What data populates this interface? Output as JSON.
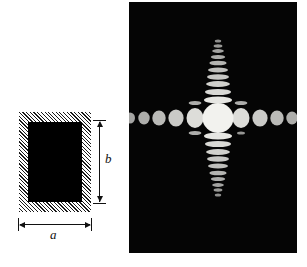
{
  "figure": {
    "background_color": "#ffffff"
  },
  "aperture_diagram": {
    "name": "rectangular-aperture",
    "screen_fill": "hatched",
    "hatch_angle_deg": 45,
    "hatch_color": "#1a1a1a",
    "opening_color": "#000000",
    "dimension_width_label": "a",
    "dimension_height_label": "b",
    "screen": {
      "x": 19,
      "y": 112,
      "width": 72,
      "height": 100
    },
    "opening": {
      "x": 28,
      "y": 122,
      "width": 54,
      "height": 80
    }
  },
  "diffraction_pattern": {
    "name": "fraunhofer-diffraction-pattern",
    "background_color": "#050505",
    "spot_color": "#f2f2ee",
    "panel": {
      "x": 129,
      "y": 2,
      "width": 168,
      "height": 251
    },
    "center": {
      "x": 89,
      "y": 116
    },
    "description": "Cross-shaped Fraunhofer diffraction pattern of a rectangular aperture: a bright central maximum with a horizontal row of round side lobes and a vertical column of narrow elongated lobes."
  },
  "chart_data": {
    "type": "scatter",
    "xlabel": "",
    "ylabel": "",
    "grid": false,
    "legend": false,
    "background": "#050505",
    "marker_color": "#f2f2ee",
    "xlim": [
      0,
      168
    ],
    "ylim": [
      0,
      251
    ],
    "center": [
      89,
      116
    ],
    "series": [
      {
        "name": "central-maximum",
        "points": [
          {
            "x": 89,
            "y": 116,
            "rx": 15.5,
            "ry": 15.0,
            "intensity": 1.0
          }
        ]
      },
      {
        "name": "horizontal-lobes-left",
        "points": [
          {
            "x": 66,
            "y": 116,
            "rx": 8.5,
            "ry": 10.0,
            "order": -1,
            "intensity": 0.86
          },
          {
            "x": 47,
            "y": 116,
            "rx": 7.6,
            "ry": 8.6,
            "order": -2,
            "intensity": 0.74
          },
          {
            "x": 30,
            "y": 116,
            "rx": 6.7,
            "ry": 7.4,
            "order": -3,
            "intensity": 0.64
          },
          {
            "x": 15,
            "y": 116,
            "rx": 5.7,
            "ry": 6.4,
            "order": -4,
            "intensity": 0.56
          },
          {
            "x": 1,
            "y": 116,
            "rx": 5.0,
            "ry": 5.6,
            "order": -5,
            "intensity": 0.5
          }
        ]
      },
      {
        "name": "horizontal-lobes-right",
        "points": [
          {
            "x": 112,
            "y": 116,
            "rx": 8.5,
            "ry": 10.0,
            "order": 1,
            "intensity": 0.86
          },
          {
            "x": 131,
            "y": 116,
            "rx": 7.6,
            "ry": 8.6,
            "order": 2,
            "intensity": 0.74
          },
          {
            "x": 148,
            "y": 116,
            "rx": 6.7,
            "ry": 7.4,
            "order": 3,
            "intensity": 0.64
          },
          {
            "x": 163,
            "y": 116,
            "rx": 5.7,
            "ry": 6.4,
            "order": 4,
            "intensity": 0.56
          }
        ]
      },
      {
        "name": "vertical-lobes-up",
        "points": [
          {
            "x": 89,
            "y": 98,
            "rx": 14.0,
            "ry": 3.6,
            "order": 1,
            "intensity": 0.92
          },
          {
            "x": 89,
            "y": 90,
            "rx": 13.0,
            "ry": 3.1,
            "order": 2,
            "intensity": 0.84
          },
          {
            "x": 89,
            "y": 82,
            "rx": 12.0,
            "ry": 2.9,
            "order": 3,
            "intensity": 0.78
          },
          {
            "x": 89,
            "y": 75,
            "rx": 11.0,
            "ry": 2.7,
            "order": 4,
            "intensity": 0.72
          },
          {
            "x": 89,
            "y": 68,
            "rx": 10.0,
            "ry": 2.5,
            "order": 5,
            "intensity": 0.66
          },
          {
            "x": 89,
            "y": 61,
            "rx": 8.6,
            "ry": 2.3,
            "order": 6,
            "intensity": 0.6
          },
          {
            "x": 89,
            "y": 55,
            "rx": 7.2,
            "ry": 2.1,
            "order": 7,
            "intensity": 0.54
          },
          {
            "x": 89,
            "y": 49,
            "rx": 5.8,
            "ry": 1.9,
            "order": 8,
            "intensity": 0.48
          },
          {
            "x": 89,
            "y": 44,
            "rx": 4.4,
            "ry": 1.7,
            "order": 9,
            "intensity": 0.42
          },
          {
            "x": 89,
            "y": 39,
            "rx": 3.2,
            "ry": 1.5,
            "order": 10,
            "intensity": 0.36
          }
        ]
      },
      {
        "name": "vertical-lobes-down",
        "points": [
          {
            "x": 89,
            "y": 134,
            "rx": 14.0,
            "ry": 3.6,
            "order": -1,
            "intensity": 0.92
          },
          {
            "x": 89,
            "y": 142,
            "rx": 13.0,
            "ry": 3.1,
            "order": -2,
            "intensity": 0.84
          },
          {
            "x": 89,
            "y": 150,
            "rx": 12.0,
            "ry": 2.9,
            "order": -3,
            "intensity": 0.78
          },
          {
            "x": 89,
            "y": 157,
            "rx": 11.0,
            "ry": 2.7,
            "order": -4,
            "intensity": 0.72
          },
          {
            "x": 89,
            "y": 164,
            "rx": 10.0,
            "ry": 2.5,
            "order": -5,
            "intensity": 0.66
          },
          {
            "x": 89,
            "y": 171,
            "rx": 8.6,
            "ry": 2.3,
            "order": -6,
            "intensity": 0.6
          },
          {
            "x": 89,
            "y": 177,
            "rx": 7.2,
            "ry": 2.1,
            "order": -7,
            "intensity": 0.54
          },
          {
            "x": 89,
            "y": 183,
            "rx": 5.8,
            "ry": 1.9,
            "order": -8,
            "intensity": 0.48
          },
          {
            "x": 89,
            "y": 188,
            "rx": 4.4,
            "ry": 1.7,
            "order": -9,
            "intensity": 0.42
          },
          {
            "x": 89,
            "y": 193,
            "rx": 3.2,
            "ry": 1.5,
            "order": -10,
            "intensity": 0.36
          }
        ]
      },
      {
        "name": "first-order-vertical-satellites",
        "points": [
          {
            "x": 66,
            "y": 101,
            "rx": 6.4,
            "ry": 2.0,
            "intensity": 0.55
          },
          {
            "x": 66,
            "y": 131,
            "rx": 6.4,
            "ry": 2.0,
            "intensity": 0.55
          },
          {
            "x": 112,
            "y": 101,
            "rx": 6.4,
            "ry": 2.0,
            "intensity": 0.55
          },
          {
            "x": 112,
            "y": 131,
            "rx": 4.0,
            "ry": 1.6,
            "intensity": 0.4
          }
        ]
      }
    ]
  }
}
